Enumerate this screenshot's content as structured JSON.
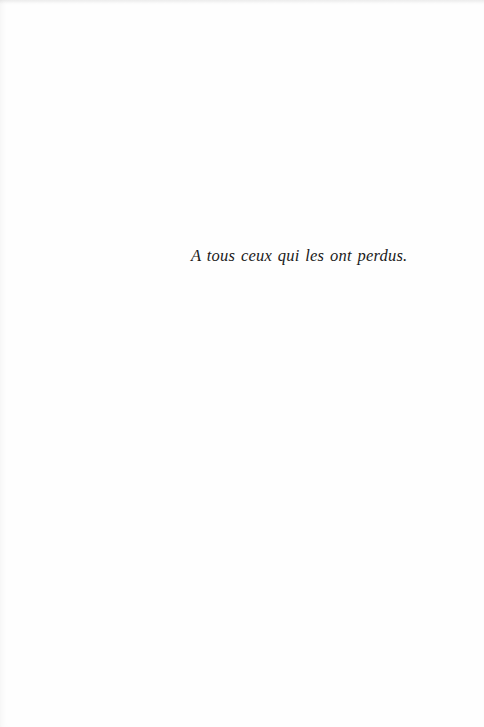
{
  "page": {
    "background_color": "#fefefe",
    "text_color": "#1a1a1a"
  },
  "dedication": {
    "text": "A tous ceux qui les ont perdus."
  }
}
